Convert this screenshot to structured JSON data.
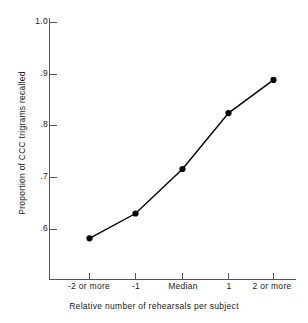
{
  "chart_data": {
    "type": "line",
    "title": "",
    "xlabel": "Relative number of rehearsals per subject",
    "ylabel": "Proportion of CCC trigrams recalled",
    "categories": [
      "-2 or more",
      "-1",
      "Median",
      "1",
      "2 or more"
    ],
    "values": [
      0.583,
      0.631,
      0.717,
      0.825,
      0.889
    ],
    "ytick_labels": [
      "1.0",
      ".9",
      ".8",
      ".7",
      ".6"
    ],
    "ytick_values": [
      1.0,
      0.9,
      0.8,
      0.7,
      0.6
    ],
    "ylim": [
      0.56,
      1.0
    ],
    "xlim_categories": 5,
    "grid": false,
    "legend": false,
    "marker": "filled-circle",
    "line_color": "#000000",
    "marker_color": "#000000",
    "axis_color": "#555555",
    "background": "#ffffff",
    "series": [
      {
        "name": "Proportion of CCC trigrams recalled",
        "values": [
          0.583,
          0.631,
          0.717,
          0.825,
          0.889
        ]
      }
    ]
  },
  "axes": {
    "y_label_text": "Proportion of CCC trigrams recalled",
    "x_label_text": "Relative number of rehearsals per subject"
  }
}
